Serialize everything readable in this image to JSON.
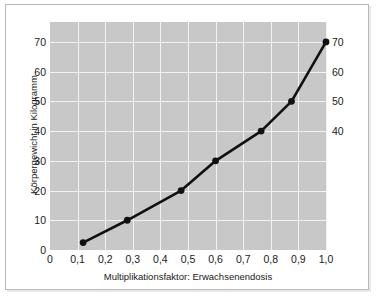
{
  "chart_data": {
    "type": "line",
    "title": "",
    "xlabel": "Multiplikationsfaktor: Erwachsenendosis",
    "ylabel": "Körpergewicht in Kilogramm",
    "xlim": [
      0,
      1.0
    ],
    "ylim": [
      0,
      76.7
    ],
    "grid": true,
    "legend": "none",
    "x_ticks": [
      "0",
      "0,1",
      "0,2",
      "0,3",
      "0,4",
      "0,5",
      "0,6",
      "0,7",
      "0,8",
      "0,9",
      "1,0"
    ],
    "x_tick_values": [
      0,
      0.1,
      0.2,
      0.3,
      0.4,
      0.5,
      0.6,
      0.7,
      0.8,
      0.9,
      1.0
    ],
    "y_ticks_left": [
      "0",
      "10",
      "20",
      "30",
      "40",
      "50",
      "60",
      "70"
    ],
    "y_tick_values_left": [
      0,
      10,
      20,
      30,
      40,
      50,
      60,
      70
    ],
    "y_ticks_right": [
      "40",
      "50",
      "60",
      "70"
    ],
    "y_tick_values_right": [
      40,
      50,
      60,
      70
    ],
    "series": [
      {
        "name": "Körpergewicht vs. Multiplikationsfaktor",
        "marker": "circle",
        "color": "#111111",
        "x": [
          0.12,
          0.28,
          0.475,
          0.6,
          0.765,
          0.875,
          1.0
        ],
        "values": [
          2.5,
          10,
          20,
          30,
          40,
          50,
          70
        ]
      }
    ],
    "points_labeled": [
      {
        "x": 0.12,
        "y": 2.5
      },
      {
        "x": 0.28,
        "y": 10
      },
      {
        "x": 0.475,
        "y": 20
      },
      {
        "x": 0.6,
        "y": 30
      },
      {
        "x": 0.765,
        "y": 40
      },
      {
        "x": 0.875,
        "y": 50
      },
      {
        "x": 1.0,
        "y": 70
      }
    ],
    "colors": {
      "plot_background": "#c8c8c8",
      "gridline": "#f2f2f2",
      "line": "#111111",
      "marker": "#111111",
      "page_background": "#ffffff",
      "frame_border": "#b9b9b9",
      "text": "#1a1a1a"
    }
  }
}
